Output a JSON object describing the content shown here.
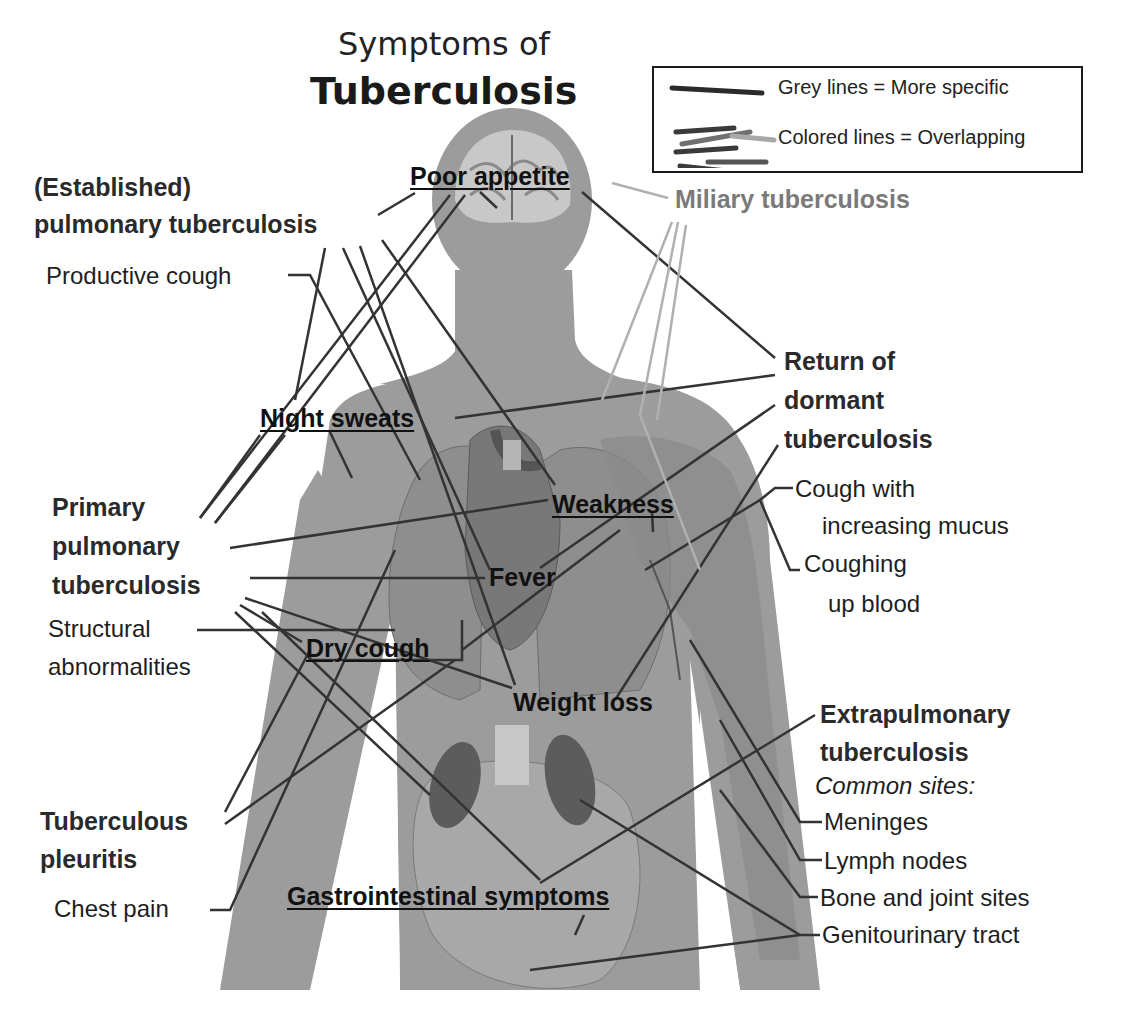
{
  "title": {
    "line1": "Symptoms of",
    "line2": "Tuberculosis"
  },
  "legend": {
    "items": [
      {
        "swatch": "single-dark-line",
        "label": "Grey lines = More specific"
      },
      {
        "swatch": "multi-colored-lines",
        "label": "Colored lines = Overlapping"
      }
    ]
  },
  "categories": {
    "established_pulmonary": {
      "line1": "(Established)",
      "line2": "pulmonary tuberculosis"
    },
    "miliary": {
      "label": "Miliary tuberculosis"
    },
    "return_dormant": {
      "line1": "Return of",
      "line2": "dormant",
      "line3": "tuberculosis"
    },
    "primary_pulmonary": {
      "line1": "Primary",
      "line2": "pulmonary",
      "line3": "tuberculosis"
    },
    "tuberculous_pleuritis": {
      "line1": "Tuberculous",
      "line2": "pleuritis"
    },
    "extrapulmonary": {
      "line1": "Extrapulmonary",
      "line2": "tuberculosis",
      "subheading": "Common sites:"
    }
  },
  "specific_symptoms": {
    "productive_cough": "Productive cough",
    "cough_mucus_line1": "Cough with",
    "cough_mucus_line2": "increasing mucus",
    "coughing_blood_line1": "Coughing",
    "coughing_blood_line2": "up blood",
    "structural_line1": "Structural",
    "structural_line2": "abnormalities",
    "chest_pain": "Chest pain"
  },
  "extrapulmonary_sites": [
    "Meninges",
    "Lymph nodes",
    "Bone and joint sites",
    "Genitourinary tract"
  ],
  "shared_symptoms": {
    "poor_appetite": "Poor appetite",
    "night_sweats": "Night sweats",
    "weakness": "Weakness",
    "fever": "Fever",
    "dry_cough": "Dry cough",
    "weight_loss": "Weight loss",
    "gastrointestinal": "Gastrointestinal symptoms"
  },
  "colors": {
    "background": "#ffffff",
    "silhouette": "#9c9c9c",
    "organs": "#7d7d7d",
    "specific_line": "#333333",
    "overlap_line": "#b0b0b0",
    "text": "#1a1a1a",
    "miliary_text": "#7a7a7a"
  }
}
